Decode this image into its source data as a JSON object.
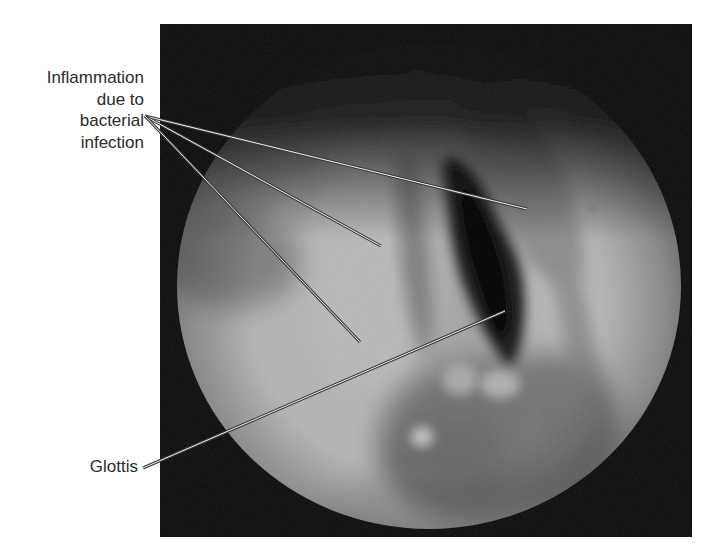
{
  "figure": {
    "type": "annotated endoscopic photograph",
    "photo_background_color": "#0b0b0b",
    "tissue_tone_color": "#a9a9a9",
    "leader_line_color": "#f2f2f2"
  },
  "labels": {
    "inflammation": {
      "lines": [
        "Inflammation",
        "due to",
        "bacterial",
        "infection"
      ],
      "pointer_count": 3
    },
    "glottis": {
      "text": "Glottis",
      "pointer_count": 1
    }
  }
}
